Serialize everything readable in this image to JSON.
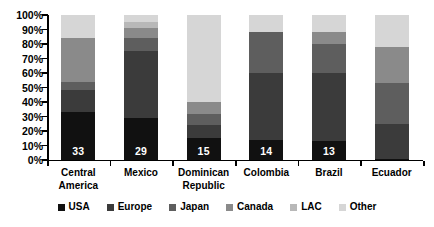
{
  "chart_data": {
    "type": "bar",
    "subtype": "stacked-100-percent",
    "title": "",
    "xlabel": "",
    "ylabel": "",
    "ylim": [
      0,
      100
    ],
    "grid": false,
    "legend_position": "bottom",
    "y_ticks": [
      "0%",
      "10%",
      "20%",
      "30%",
      "40%",
      "50%",
      "60%",
      "70%",
      "80%",
      "90%",
      "100%"
    ],
    "categories": [
      "Central America",
      "Mexico",
      "Dominican Republic",
      "Colombia",
      "Brazil",
      "Ecuador"
    ],
    "category_lines": [
      [
        "Central",
        "America"
      ],
      [
        "Mexico"
      ],
      [
        "Dominican",
        "Republic"
      ],
      [
        "Colombia"
      ],
      [
        "Brazil"
      ],
      [
        "Ecuador"
      ]
    ],
    "series": [
      {
        "name": "USA",
        "color": "#111111",
        "values": [
          33,
          29,
          15,
          14,
          13,
          1
        ]
      },
      {
        "name": "Europe",
        "color": "#3b3b3b",
        "values": [
          15,
          46,
          9,
          46,
          47,
          24
        ]
      },
      {
        "name": "Japan",
        "color": "#5e5e5e",
        "values": [
          6,
          9,
          8,
          28,
          20,
          28
        ]
      },
      {
        "name": "Canada",
        "color": "#8a8a8a",
        "values": [
          30,
          7,
          8,
          0,
          8,
          25
        ]
      },
      {
        "name": "LAC",
        "color": "#b8b8b8",
        "values": [
          0,
          4,
          0,
          0,
          0,
          0
        ]
      },
      {
        "name": "Other",
        "color": "#d6d6d6",
        "values": [
          16,
          5,
          60,
          12,
          12,
          22
        ]
      }
    ],
    "data_labels": [
      "33",
      "29",
      "15",
      "14",
      "13",
      "1"
    ],
    "data_label_series": "USA"
  },
  "legend": {
    "items": [
      {
        "label": "USA",
        "color": "#111111",
        "icon": "square-swatch-icon"
      },
      {
        "label": "Europe",
        "color": "#3b3b3b",
        "icon": "square-swatch-icon"
      },
      {
        "label": "Japan",
        "color": "#5e5e5e",
        "icon": "square-swatch-icon"
      },
      {
        "label": "Canada",
        "color": "#8a8a8a",
        "icon": "square-swatch-icon"
      },
      {
        "label": "LAC",
        "color": "#b8b8b8",
        "icon": "square-swatch-icon"
      },
      {
        "label": "Other",
        "color": "#d6d6d6",
        "icon": "square-swatch-icon"
      }
    ]
  }
}
